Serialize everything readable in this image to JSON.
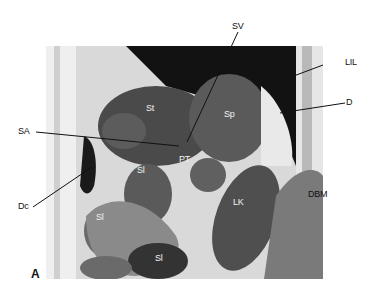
{
  "figure": {
    "panel_letter": "A",
    "external_labels": {
      "SV": "SV",
      "LIL": "LIL",
      "D": "D",
      "SA": "SA",
      "Dc": "Dc",
      "DBM": "DBM"
    },
    "internal_labels": {
      "St": "St",
      "Sp": "Sp",
      "PT": "PT",
      "Sl_upper": "Sl",
      "Sl_left": "Sl",
      "Sl_bottom": "Sl",
      "LK": "LK"
    },
    "colors": {
      "background": "#ffffff",
      "dark_tissue": "#3a3a3a",
      "mid_tissue": "#6e6e6e",
      "light_tissue": "#d6d6d6",
      "air": "#111111",
      "leader_line": "#111111"
    }
  }
}
